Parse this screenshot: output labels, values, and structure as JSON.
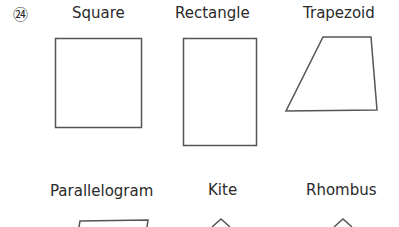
{
  "problem_number": "㉔",
  "labels": {
    "square": "Square",
    "rectangle": "Rectangle",
    "trapezoid": "Trapezoid",
    "parallelogram": "Parallelogram",
    "kite": "Kite",
    "rhombus": "Rhombus"
  },
  "stroke_color": "#555555"
}
